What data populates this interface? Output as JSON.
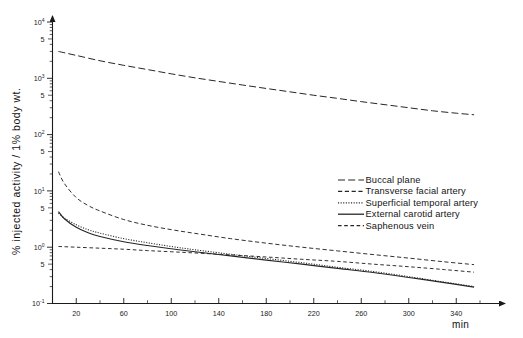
{
  "chart_data": {
    "type": "line",
    "title": "",
    "xlabel": "min",
    "ylabel": "% injected activity / 1% body wt.",
    "xlim": [
      0,
      360
    ],
    "ylim": [
      0.1,
      10000
    ],
    "yscale": "log",
    "xscale": "linear",
    "grid": false,
    "legend_position": "right-middle",
    "x_ticks_major": [
      20,
      60,
      100,
      140,
      180,
      220,
      260,
      300,
      340
    ],
    "x_ticks_major_labels": [
      "20",
      "60",
      "100",
      "140",
      "180",
      "220",
      "260",
      "300",
      "340"
    ],
    "x_ticks_minor": [
      40,
      80,
      120,
      160,
      200,
      240,
      280,
      320,
      360
    ],
    "y_ticks": [
      {
        "value": 10000,
        "label": "10",
        "sup": "4"
      },
      {
        "value": 5000,
        "label": "5",
        "sup": ""
      },
      {
        "value": 1000,
        "label": "10",
        "sup": "3"
      },
      {
        "value": 500,
        "label": "5",
        "sup": ""
      },
      {
        "value": 100,
        "label": "10",
        "sup": "2"
      },
      {
        "value": 50,
        "label": "5",
        "sup": ""
      },
      {
        "value": 10,
        "label": "10",
        "sup": "1"
      },
      {
        "value": 5,
        "label": "5",
        "sup": ""
      },
      {
        "value": 1,
        "label": "10",
        "sup": "0"
      },
      {
        "value": 0.5,
        "label": "5",
        "sup": ""
      },
      {
        "value": 0.1,
        "label": "10",
        "sup": "-1"
      }
    ],
    "series": [
      {
        "name": "Buccal plane",
        "style": "long-dash",
        "color": "#262626",
        "x": [
          5,
          20,
          40,
          60,
          80,
          100,
          120,
          140,
          160,
          180,
          200,
          220,
          240,
          260,
          280,
          300,
          320,
          340,
          355
        ],
        "y": [
          3000,
          2550,
          2050,
          1700,
          1430,
          1200,
          1020,
          880,
          760,
          660,
          575,
          500,
          440,
          385,
          340,
          300,
          265,
          240,
          225
        ]
      },
      {
        "name": "Transverse facial artery",
        "style": "dash",
        "color": "#262626",
        "x": [
          5,
          10,
          20,
          30,
          40,
          60,
          80,
          100,
          120,
          150,
          180,
          210,
          240,
          270,
          300,
          330,
          355
        ],
        "y": [
          22,
          13.5,
          7.6,
          5.5,
          4.4,
          3.1,
          2.45,
          2.05,
          1.76,
          1.42,
          1.18,
          1.0,
          0.86,
          0.74,
          0.64,
          0.55,
          0.49
        ]
      },
      {
        "name": "Superficial temporal artery",
        "style": "dotted",
        "color": "#3a3a3a",
        "x": [
          5,
          10,
          20,
          30,
          40,
          60,
          80,
          100,
          120,
          150,
          180,
          210,
          240,
          270,
          300,
          330,
          355
        ],
        "y": [
          4.0,
          3.3,
          2.5,
          2.05,
          1.78,
          1.42,
          1.2,
          1.03,
          0.9,
          0.75,
          0.63,
          0.53,
          0.44,
          0.37,
          0.3,
          0.24,
          0.2
        ]
      },
      {
        "name": "External carotid artery",
        "style": "solid",
        "color": "#1a1a1a",
        "x": [
          5,
          10,
          20,
          30,
          40,
          60,
          80,
          100,
          120,
          150,
          180,
          210,
          240,
          270,
          300,
          330,
          355
        ],
        "y": [
          4.3,
          3.2,
          2.25,
          1.8,
          1.55,
          1.25,
          1.07,
          0.94,
          0.83,
          0.7,
          0.59,
          0.5,
          0.42,
          0.355,
          0.29,
          0.235,
          0.195
        ]
      },
      {
        "name": "Saphenous vein",
        "style": "dash-short",
        "color": "#262626",
        "x": [
          5,
          20,
          40,
          60,
          80,
          100,
          120,
          150,
          180,
          210,
          240,
          270,
          300,
          330,
          355
        ],
        "y": [
          1.03,
          1.0,
          0.96,
          0.92,
          0.87,
          0.83,
          0.79,
          0.73,
          0.67,
          0.61,
          0.56,
          0.5,
          0.45,
          0.4,
          0.36
        ]
      }
    ]
  },
  "legend": {
    "items": [
      {
        "label": "Buccal plane",
        "style": "long-dash"
      },
      {
        "label": "Transverse facial artery",
        "style": "dash"
      },
      {
        "label": "Superficial temporal artery",
        "style": "dotted"
      },
      {
        "label": "External carotid artery",
        "style": "solid"
      },
      {
        "label": "Saphenous vein",
        "style": "dash-short"
      }
    ]
  },
  "axes": {
    "x_unit": "min",
    "y_title": "% injected activity / 1% body wt."
  }
}
